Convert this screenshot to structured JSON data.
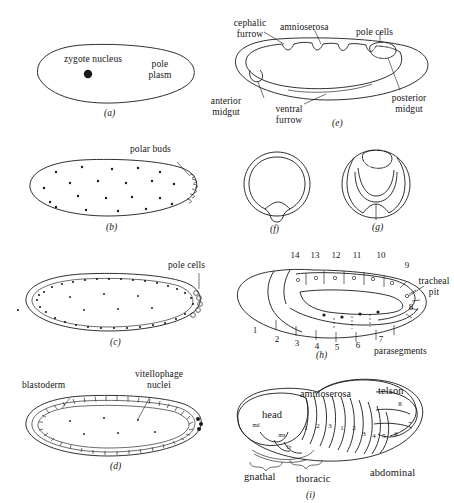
{
  "figure": {
    "background_color": "#ffffff",
    "ink_color": "#1a1a1a"
  },
  "panels": [
    {
      "id": "a",
      "letter": "(a)",
      "description": "zygote with single nucleus and pole plasm",
      "labels": [
        {
          "name": "zygote-nucleus",
          "text": "zygote nucleus"
        },
        {
          "name": "pole-plasm",
          "text": "pole\nplasm"
        }
      ]
    },
    {
      "id": "b",
      "letter": "(b)",
      "description": "cleavage nuclei distributed in yolk with polar buds at posterior",
      "labels": [
        {
          "name": "polar-buds",
          "text": "polar buds"
        }
      ]
    },
    {
      "id": "c",
      "letter": "(c)",
      "description": "syncytial blastoderm with nuclei at periphery and pole cells",
      "labels": [
        {
          "name": "pole-cells",
          "text": "pole cells"
        }
      ]
    },
    {
      "id": "d",
      "letter": "(d)",
      "description": "cellular blastoderm with vitellophage nuclei inside yolk",
      "labels": [
        {
          "name": "blastoderm",
          "text": "blastoderm"
        },
        {
          "name": "vitellophage-nuclei",
          "text": "vitellophage\nnuclei"
        }
      ]
    },
    {
      "id": "e",
      "letter": "(e)",
      "description": "gastrulating embryo, sagittal view",
      "labels": [
        {
          "name": "cephalic-furrow",
          "text": "cephalic\nfurrow"
        },
        {
          "name": "amnioserosa",
          "text": "amnioserosa"
        },
        {
          "name": "pole-cells",
          "text": "pole cells"
        },
        {
          "name": "anterior-midgut",
          "text": "anterior\nmidgut"
        },
        {
          "name": "ventral-furrow",
          "text": "ventral\nfurrow"
        },
        {
          "name": "posterior-midgut",
          "text": "posterior\nmidgut"
        }
      ]
    },
    {
      "id": "f",
      "letter": "(f)",
      "description": "transverse section showing ventral furrow invagination",
      "labels": []
    },
    {
      "id": "g",
      "letter": "(g)",
      "description": "transverse section at a more posterior level with pole cells",
      "labels": []
    },
    {
      "id": "h",
      "letter": "(h)",
      "description": "extended germ band embryo showing parasegments",
      "labels": [
        {
          "name": "tracheal-pit",
          "text": "tracheal\npit"
        },
        {
          "name": "parasegments",
          "text": "parasegments"
        }
      ],
      "parasegment_numbers_upper": [
        "14",
        "13",
        "12",
        "11",
        "10",
        "9"
      ],
      "parasegment_numbers_lower": [
        "1",
        "2",
        "3",
        "4",
        "5",
        "6",
        "7",
        "8"
      ]
    },
    {
      "id": "i",
      "letter": "(i)",
      "description": "germ band retracting embryo with segmented body regions",
      "labels": [
        {
          "name": "head",
          "text": "head"
        },
        {
          "name": "amnioserosa",
          "text": "amnioserosa"
        },
        {
          "name": "telson",
          "text": "telson"
        },
        {
          "name": "gnathal",
          "text": "gnathal"
        },
        {
          "name": "thoracic",
          "text": "thoracic"
        },
        {
          "name": "abdominal",
          "text": "abdominal"
        }
      ],
      "gnathal_segments": [
        "md",
        "mx",
        "lb"
      ],
      "thoracic_segments": [
        "1",
        "2",
        "3"
      ],
      "abdominal_segments": [
        "1",
        "2",
        "3",
        "4",
        "5",
        "6",
        "7",
        "8"
      ]
    }
  ]
}
